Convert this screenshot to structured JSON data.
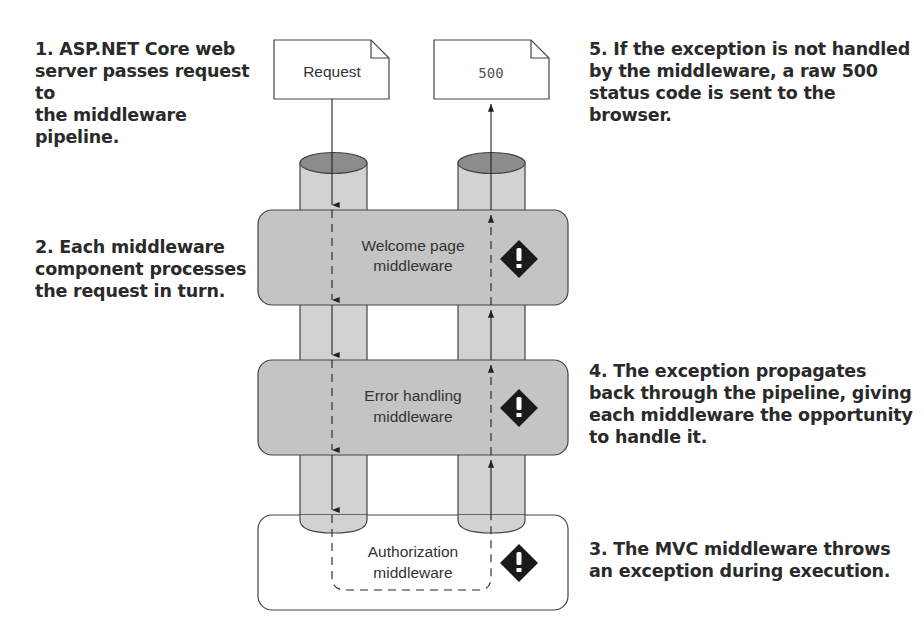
{
  "callouts": {
    "step1": "1. ASP.NET Core web\nserver passes request to\nthe middleware pipeline.",
    "step2": "2. Each middleware\ncomponent processes\nthe request in turn.",
    "step3": "3. The MVC middleware throws\nan exception during execution.",
    "step4": "4. The exception propagates\nback through the pipeline, giving\neach middleware the opportunity\nto handle it.",
    "step5": "5. If the exception is not handled\nby the middleware, a raw 500\nstatus code is sent to the browser."
  },
  "documents": {
    "request": "Request",
    "response": "500"
  },
  "middleware": [
    {
      "line1": "Welcome page",
      "line2": "middleware",
      "icon": "warning-diamond-icon"
    },
    {
      "line1": "Error handling",
      "line2": "middleware",
      "icon": "warning-diamond-icon"
    },
    {
      "line1": "Authorization",
      "line2": "middleware",
      "icon": "warning-diamond-icon"
    }
  ],
  "colors": {
    "box_fill": "#c4c4c4",
    "pipe_fill": "#d2d2d2",
    "pipe_top": "#8c8c8c",
    "stroke": "#444444",
    "icon": "#1a1a1a"
  }
}
